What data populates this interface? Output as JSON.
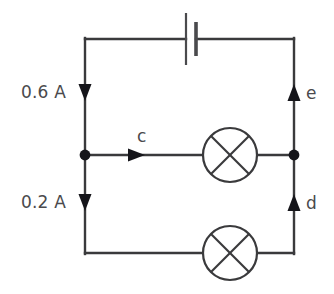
{
  "figure": {
    "type": "electrical-circuit-diagram",
    "background_color": "#ffffff",
    "wire_color": "#3a3a3c",
    "label_color": "#4a4a4d",
    "junction_color": "#15151a"
  },
  "labels": {
    "current_top": "0.6 A",
    "current_bottom": "0.2 A",
    "point_c": "c",
    "point_d": "d",
    "point_e": "e"
  },
  "components": {
    "battery": {
      "name": "cell",
      "position": "top-wire",
      "long_plate_x": 186,
      "short_plate_x": 196
    },
    "lamp_middle": {
      "name": "lamp",
      "symbol": "circle-with-cross",
      "center_x": 230,
      "center_y": 155,
      "radius": 27
    },
    "lamp_bottom": {
      "name": "lamp",
      "symbol": "circle-with-cross",
      "center_x": 230,
      "center_y": 253,
      "radius": 27
    }
  },
  "junctions": [
    {
      "name": "left-node",
      "x": 85,
      "y": 155
    },
    {
      "name": "right-node",
      "x": 294,
      "y": 155
    }
  ],
  "current_arrows": [
    {
      "name": "current-arrow-top-left",
      "direction": "down",
      "label": "0.6 A",
      "x": 85,
      "y": 95
    },
    {
      "name": "current-arrow-bottom-left",
      "direction": "down",
      "label": "0.2 A",
      "x": 85,
      "y": 205
    },
    {
      "name": "current-arrow-middle",
      "direction": "right",
      "label": "c",
      "x": 128,
      "y": 155
    },
    {
      "name": "current-arrow-top-right",
      "direction": "up",
      "label": "e",
      "x": 294,
      "y": 95
    },
    {
      "name": "current-arrow-bottom-right",
      "direction": "up",
      "label": "d",
      "x": 294,
      "y": 205
    }
  ]
}
